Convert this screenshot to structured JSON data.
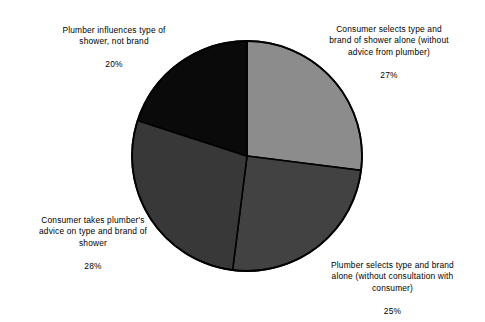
{
  "chart_data": {
    "type": "pie",
    "title": "",
    "subtitle": "",
    "xlabel": "",
    "ylabel": "",
    "legend_position": "none",
    "grid": false,
    "start_angle_deg": 0,
    "direction": "clockwise",
    "categories": [
      "Consumer selects type and brand of shower alone (without advice from plumber)",
      "Plumber selects type and brand alone (without consultation with consumer)",
      "Consumer takes plumber's advice on type and brand of shower",
      "Plumber influences type of shower, not brand"
    ],
    "values": [
      27,
      25,
      28,
      20
    ],
    "value_unit": "%",
    "slices": [
      {
        "label": "Consumer selects type and brand of shower alone (without advice from plumber)",
        "value": 27,
        "value_text": "27%",
        "color": "#8c8c8c",
        "position": "top-right"
      },
      {
        "label": "Plumber selects type and brand alone (without consultation with consumer)",
        "value": 25,
        "value_text": "25%",
        "color": "#424242",
        "position": "bottom-right"
      },
      {
        "label": "Consumer takes plumber's advice on type and brand of shower",
        "value": 28,
        "value_text": "28%",
        "color": "#383838",
        "position": "bottom-left"
      },
      {
        "label": "Plumber influences type of shower, not brand",
        "value": 20,
        "value_text": "20%",
        "color": "#0a0a0a",
        "position": "top-left"
      }
    ],
    "outline_color": "#000000",
    "background_color": "#ffffff"
  },
  "labels": {
    "top_left": {
      "text": "Plumber influences type of\nshower, not brand",
      "value": "20%"
    },
    "top_right": {
      "text": "Consumer selects type and\nbrand of shower alone (without\nadvice from plumber)",
      "value": "27%"
    },
    "bottom_left": {
      "text": "Consumer takes plumber's\nadvice on type and brand of\nshower",
      "value": "28%"
    },
    "bottom_right": {
      "text": "Plumber selects type and brand\nalone (without consultation with\nconsumer)",
      "value": "25%"
    }
  }
}
